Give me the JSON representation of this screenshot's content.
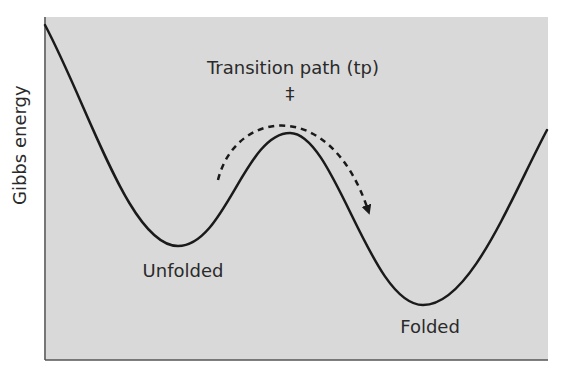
{
  "diagram": {
    "y_axis_label": "Gibbs energy",
    "x_axis_label": "",
    "states": [
      {
        "id": "unfolded",
        "label": "Unfolded",
        "x": 178,
        "y": 246
      },
      {
        "id": "transition",
        "label": "‡",
        "x": 290,
        "y": 133
      },
      {
        "id": "folded",
        "label": "Folded",
        "x": 423,
        "y": 305
      }
    ],
    "transition_path_label": "Transition path (tp)",
    "transition_state_symbol": "‡",
    "arrow": {
      "style": "dashed",
      "direction": "unfolded-to-folded"
    },
    "colors": {
      "panel_background": "#d9d9d9",
      "curve": "#1a1a1a",
      "text": "#2a2a2a",
      "axis": "#555555"
    }
  }
}
